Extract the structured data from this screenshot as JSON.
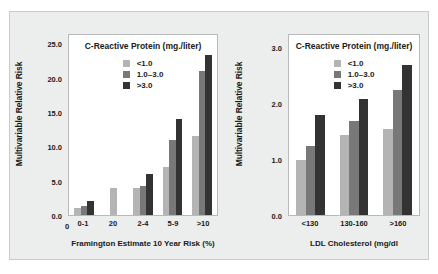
{
  "colors": {
    "figure_bg": "#eceded",
    "plot_bg": "#ffffff",
    "frame": "#b8baba",
    "series_low": "#b4b4b4",
    "series_mid": "#787878",
    "series_high": "#333333",
    "text": "#1a1a1a"
  },
  "legend": {
    "title": "C-Reactive Protein (mg./liter)",
    "items": [
      {
        "label": "<1.0",
        "color": "#b4b4b4"
      },
      {
        "label": "1.0–3.0",
        "color": "#787878"
      },
      {
        "label": ">3.0",
        "color": "#333333"
      }
    ]
  },
  "chart_data": [
    {
      "type": "bar",
      "title": "C-Reactive Protein (mg./liter)",
      "xlabel": "Framington Estimate 10 Year Risk (%)",
      "ylabel": "Multivariable Relative Risk",
      "categories": [
        "0-1",
        "20",
        "2-4",
        "5-9",
        ">10"
      ],
      "yticks": [
        "0.0",
        "5.0",
        "10.0",
        "15.0",
        "20.0",
        "25.0"
      ],
      "ytick_values": [
        0,
        5,
        10,
        15,
        20,
        25
      ],
      "ylim": [
        0,
        26.5
      ],
      "x_origin_label": "0",
      "grid": false,
      "legend_position": "top-center",
      "series": [
        {
          "name": "<1.0",
          "color": "#b4b4b4",
          "values": [
            1.0,
            4.0,
            4.0,
            7.0,
            11.6
          ]
        },
        {
          "name": "1.0–3.0",
          "color": "#787878",
          "values": [
            1.3,
            0,
            4.2,
            11.1,
            21.2
          ]
        },
        {
          "name": ">3.0",
          "color": "#333333",
          "values": [
            2.1,
            0,
            6.0,
            14.2,
            23.5
          ]
        }
      ]
    },
    {
      "type": "bar",
      "title": "C-Reactive Protein (mg./liter)",
      "xlabel": "LDL Cholesterol (mg/dl",
      "ylabel": "Multivariable Relative Risk",
      "categories": [
        "<130",
        "130-160",
        ">160"
      ],
      "yticks": [
        "0.0",
        "1.0",
        "2.0",
        "3.0"
      ],
      "ytick_values": [
        0,
        1,
        2,
        3
      ],
      "ylim": [
        0,
        3.25
      ],
      "grid": false,
      "legend_position": "top-center",
      "series": [
        {
          "name": "<1.0",
          "color": "#b4b4b4",
          "values": [
            1.0,
            1.45,
            1.55
          ]
        },
        {
          "name": "1.0–3.0",
          "color": "#787878",
          "values": [
            1.25,
            1.7,
            2.25
          ]
        },
        {
          "name": ">3.0",
          "color": "#333333",
          "values": [
            1.8,
            2.1,
            2.7
          ]
        }
      ]
    }
  ]
}
